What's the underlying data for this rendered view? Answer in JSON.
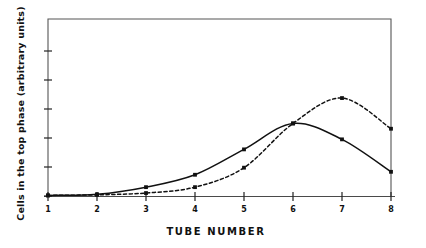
{
  "chart_data": {
    "type": "line",
    "title": "",
    "xlabel": "TUBE  NUMBER",
    "ylabel": "Cells in the top phase (arbitrary units)",
    "x": [
      1,
      2,
      3,
      4,
      5,
      6,
      7,
      8
    ],
    "xtick_labels": [
      "1",
      "2",
      "3",
      "4",
      "5",
      "6",
      "7",
      "8"
    ],
    "xlim": [
      1,
      8
    ],
    "ylim": [
      0,
      6
    ],
    "ytick_labels": [
      "",
      "",
      "",
      "",
      "",
      ""
    ],
    "grid": false,
    "legend": null,
    "axis_style": "box-frame-open-bottom",
    "series": [
      {
        "name": "solid-curve",
        "style": "solid",
        "color": "#111111",
        "marker": "square",
        "values": [
          0.02,
          0.06,
          0.3,
          0.72,
          1.58,
          2.46,
          1.92,
          0.82
        ]
      },
      {
        "name": "dashed-curve",
        "style": "dashed",
        "color": "#111111",
        "marker": "square",
        "values": [
          0.02,
          0.04,
          0.1,
          0.3,
          0.96,
          2.46,
          3.32,
          2.28
        ]
      }
    ]
  },
  "axes": {
    "x_tick_count": 8,
    "y_tick_count": 6
  }
}
